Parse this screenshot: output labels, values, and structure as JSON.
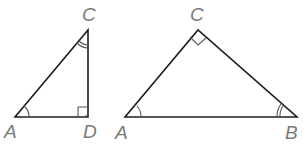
{
  "figure": {
    "triangles": [
      {
        "name": "triangle-ACD",
        "vertices": {
          "A": {
            "label": "A",
            "x": 15,
            "y": 117
          },
          "D": {
            "label": "D",
            "x": 88,
            "y": 117
          },
          "C": {
            "label": "C",
            "x": 88,
            "y": 30
          }
        },
        "right_angle_at": "D",
        "single_arc_at": "A",
        "double_arc_at": "C"
      },
      {
        "name": "triangle-ACB",
        "vertices": {
          "A": {
            "label": "A",
            "x": 125,
            "y": 117
          },
          "B": {
            "label": "B",
            "x": 297,
            "y": 117
          },
          "C": {
            "label": "C",
            "x": 198,
            "y": 30
          }
        },
        "right_angle_at": "C",
        "single_arc_at": "A",
        "double_arc_at": "B"
      }
    ],
    "colors": {
      "edge": "#1e1e1e",
      "label": "#7a7a7a"
    }
  }
}
